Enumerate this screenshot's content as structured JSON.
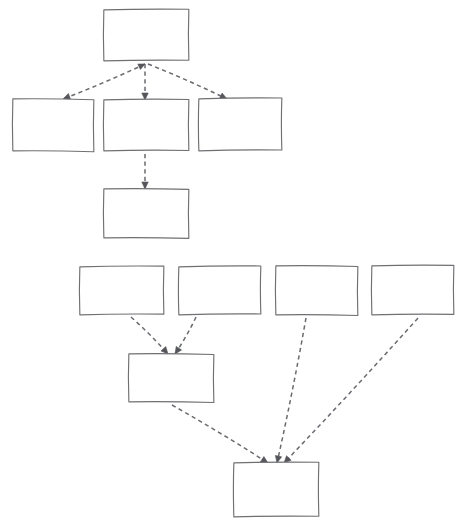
{
  "canvas": {
    "width": 470,
    "height": 528,
    "background_color": "#ffffff",
    "style": "hand-drawn-sketch"
  },
  "theme": {
    "box_stroke_color": "#6f7073",
    "box_fill_color": "#ffffff",
    "edge_stroke_color": "#6a6b70",
    "arrow_head_color": "#55565b",
    "edge_dash_pattern": "4.2 3.4",
    "box_stroke_width": 1.15,
    "edge_stroke_width": 1.5
  },
  "diagram": {
    "title": "",
    "type": "flowchart",
    "node_count": 11,
    "edge_count": 9,
    "nodes": [
      {
        "id": "node-a1",
        "label": "",
        "group": "upper",
        "row": 1,
        "x": 105,
        "y": 11,
        "width": 85,
        "height": 51,
        "skew": -0.6
      },
      {
        "id": "node-b1",
        "label": "",
        "group": "upper",
        "row": 2,
        "x": 14,
        "y": 100,
        "width": 81,
        "height": 52,
        "skew": 0.9
      },
      {
        "id": "node-b2",
        "label": "",
        "group": "upper",
        "row": 2,
        "x": 105,
        "y": 101,
        "width": 85,
        "height": 51,
        "skew": -0.4
      },
      {
        "id": "node-b3",
        "label": "",
        "group": "upper",
        "row": 2,
        "x": 200,
        "y": 100,
        "width": 83,
        "height": 52,
        "skew": -0.8
      },
      {
        "id": "node-c1",
        "label": "",
        "group": "upper",
        "row": 3,
        "x": 105,
        "y": 190,
        "width": 85,
        "height": 49,
        "skew": 0.5
      },
      {
        "id": "node-d1",
        "label": "",
        "group": "lower",
        "row": 4,
        "x": 81,
        "y": 268,
        "width": 84,
        "height": 48,
        "skew": -0.7
      },
      {
        "id": "node-d2",
        "label": "",
        "group": "lower",
        "row": 4,
        "x": 180,
        "y": 268,
        "width": 82,
        "height": 48,
        "skew": -0.9
      },
      {
        "id": "node-d3",
        "label": "",
        "group": "lower",
        "row": 4,
        "x": 277,
        "y": 267,
        "width": 82,
        "height": 49,
        "skew": 0.6
      },
      {
        "id": "node-d4",
        "label": "",
        "group": "lower",
        "row": 4,
        "x": 373,
        "y": 267,
        "width": 82,
        "height": 49,
        "skew": -0.5
      },
      {
        "id": "node-e1",
        "label": "",
        "group": "lower",
        "row": 5,
        "x": 130,
        "y": 355,
        "width": 85,
        "height": 48,
        "skew": 0.7
      },
      {
        "id": "node-f1",
        "label": "",
        "group": "lower",
        "row": 6,
        "x": 235,
        "y": 464,
        "width": 85,
        "height": 54,
        "skew": -0.6
      }
    ],
    "edges": [
      {
        "id": "edge-a1-b1",
        "from": "node-a1",
        "to": "node-b1",
        "style": "dashed",
        "arrow": "both",
        "x1": 145,
        "y1": 64,
        "x2": 63,
        "y2": 99
      },
      {
        "id": "edge-a1-b2",
        "from": "node-a1",
        "to": "node-b2",
        "style": "dashed",
        "arrow": "end",
        "x1": 145,
        "y1": 64,
        "x2": 145,
        "y2": 100
      },
      {
        "id": "edge-a1-b3",
        "from": "node-a1",
        "to": "node-b3",
        "style": "dashed",
        "arrow": "end",
        "x1": 148,
        "y1": 64,
        "x2": 227,
        "y2": 99
      },
      {
        "id": "edge-b2-c1",
        "from": "node-b2",
        "to": "node-c1",
        "style": "dashed",
        "arrow": "end",
        "x1": 145,
        "y1": 154,
        "x2": 145,
        "y2": 189
      },
      {
        "id": "edge-d1-e1",
        "from": "node-d1",
        "to": "node-e1",
        "style": "dashed",
        "arrow": "end",
        "x1": 131,
        "y1": 317,
        "x2": 168,
        "y2": 354
      },
      {
        "id": "edge-d2-e1",
        "from": "node-d2",
        "to": "node-e1",
        "style": "dashed",
        "arrow": "end",
        "x1": 196,
        "y1": 317,
        "x2": 175,
        "y2": 354
      },
      {
        "id": "edge-e1-f1",
        "from": "node-e1",
        "to": "node-f1",
        "style": "dashed",
        "arrow": "end",
        "x1": 172,
        "y1": 405,
        "x2": 268,
        "y2": 463
      },
      {
        "id": "edge-d3-f1",
        "from": "node-d3",
        "to": "node-f1",
        "style": "dashed",
        "arrow": "end",
        "x1": 306,
        "y1": 318,
        "x2": 277,
        "y2": 463
      },
      {
        "id": "edge-d4-f1",
        "from": "node-d4",
        "to": "node-f1",
        "style": "dashed",
        "arrow": "end",
        "x1": 418,
        "y1": 318,
        "x2": 284,
        "y2": 463
      }
    ]
  }
}
